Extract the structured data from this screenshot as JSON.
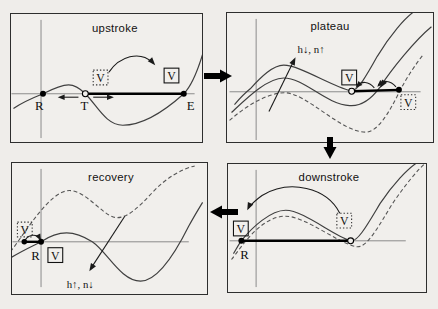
{
  "colors": {
    "background": "#efedea",
    "curve": "#3f3f3f",
    "axis_gray": "#8a8a8a",
    "ink": "#000000"
  },
  "panels": [
    {
      "title": "upstroke",
      "labels": {
        "R": "R",
        "T": "T",
        "E": "E"
      },
      "v_dotted": "V",
      "v_solid": "V"
    },
    {
      "title": "plateau",
      "gate_label": "h↓, n↑",
      "v_solid": "V",
      "v_dotted": "V"
    },
    {
      "title": "recovery",
      "gate_label": "h↑, n↓",
      "labels": {
        "R": "R"
      },
      "v_dotted": "V",
      "v_solid": "V"
    },
    {
      "title": "downstroke",
      "labels": {
        "R": "R"
      },
      "v_solid": "V",
      "v_dotted": "V"
    }
  ]
}
